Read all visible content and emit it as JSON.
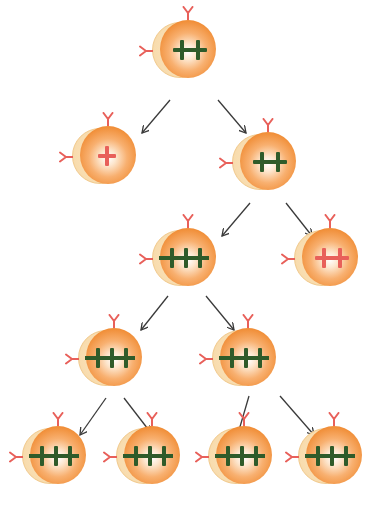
{
  "diagram": {
    "colors": {
      "cell_body": "#f08c34",
      "cell_halo": "#f8dcae",
      "receptor": "#e8605a",
      "mark_green": "#2f5b2a",
      "mark_red": "#e8605a",
      "arrow": "#3a3a3a"
    },
    "cells": [
      {
        "id": "gen1",
        "x": 150,
        "y": 14,
        "marks": 2,
        "mark_color": "green",
        "joined": false
      },
      {
        "id": "gen2-left",
        "x": 70,
        "y": 120,
        "marks": 1,
        "mark_color": "red",
        "joined": false
      },
      {
        "id": "gen2-right",
        "x": 230,
        "y": 126,
        "marks": 2,
        "mark_color": "green",
        "joined": false
      },
      {
        "id": "gen3-left",
        "x": 150,
        "y": 222,
        "marks": 3,
        "mark_color": "green",
        "joined": true
      },
      {
        "id": "gen3-right",
        "x": 292,
        "y": 222,
        "marks": 2,
        "mark_color": "red",
        "joined": false
      },
      {
        "id": "gen4-left",
        "x": 76,
        "y": 322,
        "marks": 3,
        "mark_color": "green",
        "joined": true
      },
      {
        "id": "gen4-right",
        "x": 210,
        "y": 322,
        "marks": 3,
        "mark_color": "green",
        "joined": true
      },
      {
        "id": "gen5-1",
        "x": 20,
        "y": 420,
        "marks": 3,
        "mark_color": "green",
        "joined": true
      },
      {
        "id": "gen5-2",
        "x": 114,
        "y": 420,
        "marks": 3,
        "mark_color": "green",
        "joined": true
      },
      {
        "id": "gen5-3",
        "x": 206,
        "y": 420,
        "marks": 3,
        "mark_color": "green",
        "joined": true
      },
      {
        "id": "gen5-4",
        "x": 296,
        "y": 420,
        "marks": 3,
        "mark_color": "green",
        "joined": true
      }
    ],
    "arrows": [
      {
        "from": "gen1",
        "to": "gen2-left",
        "x1": 170,
        "y1": 100,
        "x2": 142,
        "y2": 133
      },
      {
        "from": "gen1",
        "to": "gen2-right",
        "x1": 218,
        "y1": 100,
        "x2": 246,
        "y2": 133
      },
      {
        "from": "gen2-right",
        "to": "gen3-left",
        "x1": 250,
        "y1": 203,
        "x2": 222,
        "y2": 236
      },
      {
        "from": "gen2-right",
        "to": "gen3-right",
        "x1": 286,
        "y1": 203,
        "x2": 312,
        "y2": 236
      },
      {
        "from": "gen3-left",
        "to": "gen4-left",
        "x1": 168,
        "y1": 296,
        "x2": 141,
        "y2": 330
      },
      {
        "from": "gen3-left",
        "to": "gen4-right",
        "x1": 206,
        "y1": 296,
        "x2": 234,
        "y2": 330
      },
      {
        "from": "gen4-left",
        "to": "gen5-1",
        "x1": 106,
        "y1": 398,
        "x2": 80,
        "y2": 435
      },
      {
        "from": "gen4-left",
        "to": "gen5-2",
        "x1": 124,
        "y1": 398,
        "x2": 151,
        "y2": 433
      },
      {
        "from": "gen4-right",
        "to": "gen5-3",
        "x1": 249,
        "y1": 396,
        "x2": 237,
        "y2": 437
      },
      {
        "from": "gen4-right",
        "to": "gen5-4",
        "x1": 280,
        "y1": 396,
        "x2": 314,
        "y2": 435
      }
    ]
  }
}
